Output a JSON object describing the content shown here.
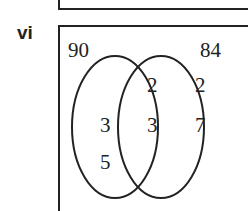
{
  "problem": {
    "label": "vi"
  },
  "venn": {
    "set_a_total": "90",
    "set_b_total": "84",
    "only_a": [
      "3",
      "5"
    ],
    "intersection": [
      "2",
      "3"
    ],
    "only_b": [
      "2",
      "7"
    ]
  }
}
